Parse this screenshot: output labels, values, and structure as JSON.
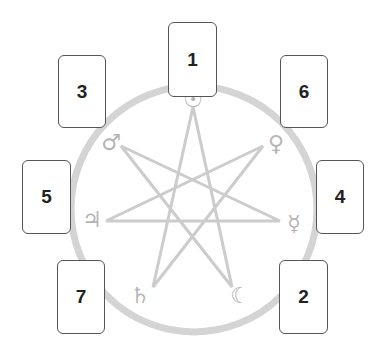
{
  "diagram": {
    "type": "seven-card tarot spread around heptagram",
    "colors": {
      "circle": "#d4d4d4",
      "star": "#cccccc",
      "symbol": "#b5b5b5",
      "card_border": "#555555",
      "card_text": "#222222"
    },
    "circle": {
      "cx": 194,
      "cy": 209,
      "r": 123,
      "stroke_width": 7
    },
    "star_points": [
      [
        193,
        107
      ],
      [
        263,
        146
      ],
      [
        280,
        221
      ],
      [
        232,
        287
      ],
      [
        153,
        287
      ],
      [
        106,
        221
      ],
      [
        121,
        146
      ]
    ],
    "symbols": [
      {
        "name": "sun",
        "glyph": "☉",
        "x": 193,
        "y": 100
      },
      {
        "name": "venus",
        "glyph": "♀",
        "x": 276,
        "y": 144
      },
      {
        "name": "mercury",
        "glyph": "☿",
        "x": 294,
        "y": 224
      },
      {
        "name": "moon",
        "glyph": "☾",
        "x": 240,
        "y": 296
      },
      {
        "name": "saturn",
        "glyph": "♄",
        "x": 140,
        "y": 296
      },
      {
        "name": "jupiter",
        "glyph": "♃",
        "x": 92,
        "y": 220
      },
      {
        "name": "mars",
        "glyph": "♂",
        "x": 111,
        "y": 143
      }
    ],
    "cards": [
      {
        "label": "1",
        "x": 168,
        "y": 22,
        "w": 49,
        "h": 75
      },
      {
        "label": "2",
        "x": 279,
        "y": 260,
        "w": 49,
        "h": 74
      },
      {
        "label": "3",
        "x": 58,
        "y": 55,
        "w": 48,
        "h": 73
      },
      {
        "label": "4",
        "x": 316,
        "y": 160,
        "w": 48,
        "h": 74
      },
      {
        "label": "5",
        "x": 22,
        "y": 160,
        "w": 49,
        "h": 74
      },
      {
        "label": "6",
        "x": 280,
        "y": 55,
        "w": 48,
        "h": 73
      },
      {
        "label": "7",
        "x": 57,
        "y": 260,
        "w": 48,
        "h": 74
      }
    ]
  }
}
